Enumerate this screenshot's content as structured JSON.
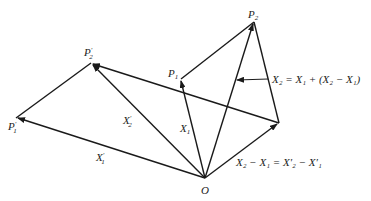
{
  "diagram": {
    "title": "",
    "points": {
      "O": {
        "label": "O",
        "x": 205,
        "y": 178
      },
      "P1p": {
        "label": "P",
        "sub": "1",
        "prime": "'",
        "x": 16,
        "y": 118
      },
      "P2p": {
        "label": "P",
        "sub": "2",
        "prime": "'",
        "x": 91,
        "y": 63
      },
      "P1": {
        "label": "P",
        "sub": "1",
        "x": 181,
        "y": 79
      },
      "P2": {
        "label": "P",
        "sub": "2",
        "x": 254,
        "y": 22
      },
      "D": {
        "label": "",
        "x": 279,
        "y": 123
      }
    },
    "labels": {
      "O": "O",
      "P1p_main": "P",
      "P1p_sub": "1",
      "P1p_prime": "′",
      "P2p_main": "P",
      "P2p_sub": "2",
      "P2p_prime": "′",
      "P1_main": "P",
      "P1_sub": "1",
      "P2_main": "P",
      "P2_sub": "2",
      "X1p_main": "X",
      "X1p_sub": "1",
      "X1p_prime": "′",
      "X2p_main": "X",
      "X2p_sub": "2",
      "X2p_prime": "′",
      "X1_main": "X",
      "X1_sub": "1",
      "eq1": "X₂ = X₁ + (X₂ − X₁)",
      "eq2": "X₂ − X₁ = X′₂ − X′₁"
    },
    "edges": [
      {
        "from": "O",
        "to": "P1p",
        "arrow": true,
        "label": "X'1"
      },
      {
        "from": "O",
        "to": "P2p",
        "arrow": true,
        "label": "X'2"
      },
      {
        "from": "P1p",
        "to": "P2p",
        "arrow": false
      },
      {
        "from": "O",
        "to": "P1",
        "arrow": true,
        "label": "X1"
      },
      {
        "from": "O",
        "to": "P2",
        "arrow": true,
        "label": "X2"
      },
      {
        "from": "P1",
        "to": "P2",
        "arrow": false
      },
      {
        "from": "P2",
        "to": "D",
        "arrow": false
      },
      {
        "from": "O",
        "to": "D",
        "arrow": true,
        "label": "X2 - X1 = X'2 - X'1"
      },
      {
        "from": "D",
        "to": "P2p",
        "arrow": true
      },
      {
        "from": "annotation",
        "to": "O-P2 line",
        "arrow": true,
        "label": "X2 = X1 + (X2 - X1)"
      }
    ]
  }
}
